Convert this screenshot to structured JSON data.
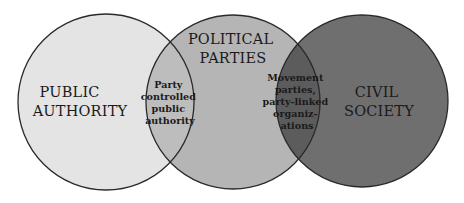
{
  "diagram": {
    "type": "venn",
    "circles": [
      {
        "id": "public-authority",
        "lines": [
          "PUBLIC",
          "AUTHORITY"
        ],
        "fill": "#e4e4e4"
      },
      {
        "id": "political-parties",
        "lines": [
          "POLITICAL",
          "PARTIES"
        ],
        "fill": "#b5b5b5"
      },
      {
        "id": "civil-society",
        "lines": [
          "CIVIL",
          "SOCIETY"
        ],
        "fill": "#6f6f6f"
      }
    ],
    "overlaps": [
      {
        "id": "authority-parties",
        "lines": [
          "Party",
          "controlled",
          "public",
          "authority"
        ],
        "fill": "#bdbdbd"
      },
      {
        "id": "parties-society",
        "lines": [
          "Movement",
          "parties,",
          "party-linked",
          "organiz-",
          "ations"
        ],
        "fill": "#5c5c5c"
      }
    ],
    "stroke": "#2a2a2a"
  }
}
